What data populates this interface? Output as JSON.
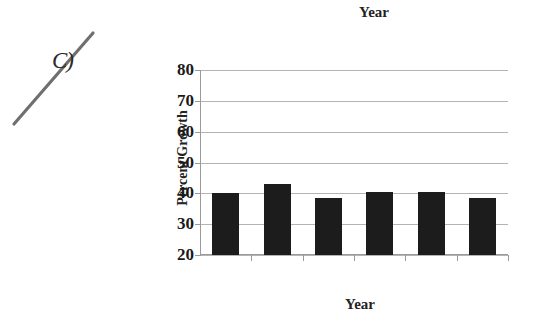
{
  "annotation": {
    "choice_label": "C)",
    "strike_mark": "diagonal-strikethrough"
  },
  "chart_data": {
    "type": "bar",
    "title": "Year",
    "xlabel": "Year",
    "ylabel": "Percent Growth",
    "categories": [
      "2000",
      "2001",
      "2002",
      "2003",
      "2004",
      "2005"
    ],
    "values": [
      40,
      43,
      38.5,
      40.5,
      40.5,
      38.5
    ],
    "ylim": [
      20,
      80
    ],
    "yticks": [
      "20",
      "30",
      "40",
      "50",
      "60",
      "70",
      "80"
    ],
    "ytick_values": [
      20,
      30,
      40,
      50,
      60,
      70,
      80
    ],
    "grid": true,
    "legend": false,
    "bar_color": "#1c1c1c",
    "grid_color": "#b4b4b4",
    "axis_color": "#9a9a9a"
  }
}
